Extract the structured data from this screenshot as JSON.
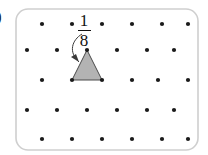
{
  "figure": {
    "part_label": ")",
    "background_color": "#ffffff",
    "border": {
      "color": "#cfcfcf",
      "radius": 12,
      "x": 16,
      "y": 9,
      "width": 182,
      "height": 141
    },
    "annotation": {
      "numerator": "1",
      "denominator": "8",
      "center_x": 84,
      "top_y": 12,
      "arrow_color": "#3a3a3a"
    },
    "lattice": {
      "dot_color": "#1a1a1a",
      "dot_radius": 2.1,
      "row_spacing": 29,
      "column_spacing": 30,
      "stagger_offset": -15,
      "origin_x": 42,
      "origin_y": 24,
      "rows": 5,
      "columns": 6,
      "points": [
        {
          "x": 42,
          "y": 24
        },
        {
          "x": 72,
          "y": 24
        },
        {
          "x": 102,
          "y": 24
        },
        {
          "x": 132,
          "y": 24
        },
        {
          "x": 162,
          "y": 24
        },
        {
          "x": 188,
          "y": 24
        },
        {
          "x": 27,
          "y": 50
        },
        {
          "x": 57,
          "y": 50
        },
        {
          "x": 87,
          "y": 50
        },
        {
          "x": 117,
          "y": 50
        },
        {
          "x": 147,
          "y": 50
        },
        {
          "x": 174,
          "y": 50
        },
        {
          "x": 42,
          "y": 80
        },
        {
          "x": 72,
          "y": 80
        },
        {
          "x": 102,
          "y": 80
        },
        {
          "x": 132,
          "y": 80
        },
        {
          "x": 158,
          "y": 80
        },
        {
          "x": 188,
          "y": 80
        },
        {
          "x": 27,
          "y": 110
        },
        {
          "x": 57,
          "y": 110
        },
        {
          "x": 87,
          "y": 110
        },
        {
          "x": 117,
          "y": 110
        },
        {
          "x": 147,
          "y": 110
        },
        {
          "x": 174,
          "y": 110
        },
        {
          "x": 42,
          "y": 139
        },
        {
          "x": 72,
          "y": 139
        },
        {
          "x": 102,
          "y": 139
        },
        {
          "x": 132,
          "y": 139
        },
        {
          "x": 162,
          "y": 139
        },
        {
          "x": 188,
          "y": 139
        }
      ]
    },
    "triangle": {
      "fill_color": "#b3b3b3",
      "stroke_color": "#4a4a4a",
      "apex": {
        "x": 87,
        "y": 50
      },
      "base_left": {
        "x": 72,
        "y": 80
      },
      "base_right": {
        "x": 102,
        "y": 80
      },
      "points_attr": "87,50 72,80 102,80"
    },
    "arrow": {
      "path": "M 82 34 C 72 40, 68 52, 79 62",
      "head": "79,62 72,57 77,55",
      "color": "#3a3a3a",
      "width": 1
    }
  }
}
